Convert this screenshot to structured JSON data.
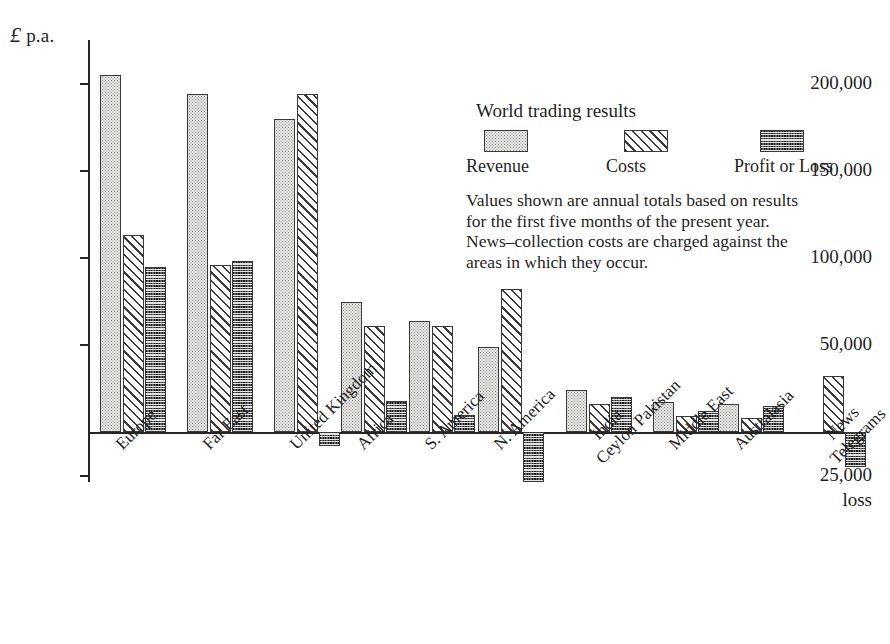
{
  "chart_data": {
    "type": "bar",
    "title": "World trading results",
    "xlabel": "",
    "ylabel": "£ p.a.",
    "ylim": [
      -29000,
      210000
    ],
    "grid": false,
    "legend_position": "inside-right",
    "y_unit_caption": "p.a.",
    "y_unit_symbol": "£",
    "tick_labels": [
      "200,000",
      "150,000",
      "100,000",
      "50,000"
    ],
    "tick_values": [
      200000,
      150000,
      100000,
      50000
    ],
    "negative_tick_label": "25,000",
    "negative_tick_sublabel": "loss",
    "negative_tick_value": -25000,
    "categories": [
      "Europe",
      "Far East",
      "United Kingdom",
      "Africa",
      "S. America",
      "N. America",
      "India\nCeylon Pakistan",
      "Middle East",
      "Australasia",
      "News\nTelegrams"
    ],
    "series": [
      {
        "name": "Revenue",
        "values": [
          205000,
          194000,
          180000,
          75000,
          64000,
          49000,
          24000,
          17000,
          16000,
          null
        ]
      },
      {
        "name": "Costs",
        "values": [
          113000,
          96000,
          194000,
          61000,
          61000,
          82000,
          16000,
          9000,
          8000,
          32000
        ]
      },
      {
        "name": "Profit or Loss",
        "values": [
          95000,
          98000,
          -8000,
          18000,
          10000,
          -29000,
          20000,
          12000,
          15000,
          -20000
        ]
      }
    ]
  },
  "legend": {
    "title": "World trading results",
    "items": [
      {
        "label": "Revenue",
        "pattern": "light-stipple"
      },
      {
        "label": "Costs",
        "pattern": "diagonal-hatch"
      },
      {
        "label": "Profit or Loss",
        "pattern": "dark-checker"
      }
    ],
    "note_lines": [
      "Values shown are annual totals based on results",
      "for the first five months of the present year.",
      "News–collection costs are charged against the",
      "areas in which they occur."
    ]
  },
  "category_labels": [
    {
      "lines": [
        "Europe"
      ]
    },
    {
      "lines": [
        "Far East"
      ]
    },
    {
      "lines": [
        "United Kingdom"
      ]
    },
    {
      "lines": [
        "Africa"
      ]
    },
    {
      "lines": [
        "S. America"
      ]
    },
    {
      "lines": [
        "N. America"
      ]
    },
    {
      "lines": [
        "India",
        "Ceylon Pakistan"
      ]
    },
    {
      "lines": [
        "Middle East"
      ]
    },
    {
      "lines": [
        "Australasia"
      ]
    },
    {
      "lines": [
        "News",
        "Telegrams"
      ]
    }
  ],
  "colors": {
    "ink": "#1f1f1f",
    "axis": "#262626",
    "revenue_fill": "#e9e9e7",
    "costs_fill": "#ffffff",
    "profit_fill": "#5f5f5f",
    "background": "#ffffff"
  }
}
